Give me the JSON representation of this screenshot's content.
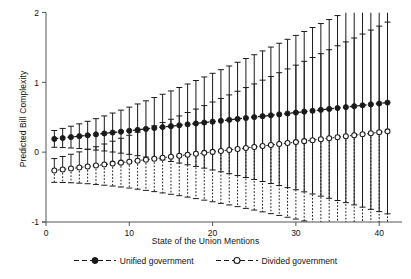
{
  "chart_data": {
    "type": "line",
    "title": "",
    "subtitle": "",
    "xlabel": "State of the Union Mentions",
    "ylabel": "Predicted Bill Complexity",
    "xlim": [
      0,
      42.5
    ],
    "ylim": [
      -1,
      2
    ],
    "xticks": [
      0,
      10,
      20,
      30,
      40
    ],
    "xticklabels": [
      "0",
      "10",
      "20",
      "30",
      "40"
    ],
    "yticks": [
      -1,
      0,
      1,
      2
    ],
    "yticklabels": [
      "-1",
      "0",
      "1",
      "2"
    ],
    "grid": false,
    "legend_position": "bottom-center",
    "x": [
      1,
      2,
      3,
      4,
      5,
      6,
      7,
      8,
      9,
      10,
      11,
      12,
      13,
      14,
      15,
      16,
      17,
      18,
      19,
      20,
      21,
      22,
      23,
      24,
      25,
      26,
      27,
      28,
      29,
      30,
      31,
      32,
      33,
      34,
      35,
      36,
      37,
      38,
      39,
      40,
      41
    ],
    "series": [
      {
        "name": "Unified government",
        "marker": "filled-circle",
        "linestyle": "dashed",
        "color": "#1a1a1a",
        "values": [
          0.19,
          0.203,
          0.216,
          0.229,
          0.242,
          0.255,
          0.268,
          0.281,
          0.294,
          0.307,
          0.32,
          0.333,
          0.346,
          0.359,
          0.372,
          0.385,
          0.398,
          0.411,
          0.424,
          0.437,
          0.45,
          0.463,
          0.476,
          0.489,
          0.502,
          0.515,
          0.528,
          0.541,
          0.554,
          0.567,
          0.58,
          0.593,
          0.606,
          0.619,
          0.632,
          0.645,
          0.658,
          0.671,
          0.684,
          0.697,
          0.71
        ],
        "ci_upper": [
          0.31,
          0.34,
          0.372,
          0.406,
          0.442,
          0.48,
          0.519,
          0.56,
          0.602,
          0.645,
          0.69,
          0.735,
          0.782,
          0.829,
          0.877,
          0.926,
          0.976,
          1.026,
          1.077,
          1.129,
          1.181,
          1.234,
          1.287,
          1.341,
          1.395,
          1.45,
          1.505,
          1.56,
          1.616,
          1.672,
          1.728,
          1.785,
          1.842,
          1.899,
          1.956,
          2.013,
          2.071,
          2.129,
          2.187,
          2.245,
          2.303
        ],
        "ci_lower": [
          0.07,
          0.066,
          0.06,
          0.052,
          0.042,
          0.03,
          0.017,
          0.002,
          -0.014,
          -0.031,
          -0.05,
          -0.069,
          -0.09,
          -0.111,
          -0.133,
          -0.156,
          -0.18,
          -0.204,
          -0.229,
          -0.255,
          -0.281,
          -0.308,
          -0.335,
          -0.363,
          -0.391,
          -0.42,
          -0.449,
          -0.478,
          -0.508,
          -0.538,
          -0.568,
          -0.599,
          -0.63,
          -0.661,
          -0.692,
          -0.723,
          -0.755,
          -0.787,
          -0.819,
          -0.851,
          -0.883
        ]
      },
      {
        "name": "Divided government",
        "marker": "open-circle",
        "linestyle": "dotted",
        "color": "#1a1a1a",
        "values": [
          -0.262,
          -0.248,
          -0.234,
          -0.22,
          -0.206,
          -0.192,
          -0.178,
          -0.164,
          -0.15,
          -0.136,
          -0.122,
          -0.108,
          -0.094,
          -0.08,
          -0.066,
          -0.052,
          -0.038,
          -0.024,
          -0.01,
          0.004,
          0.018,
          0.032,
          0.046,
          0.06,
          0.074,
          0.088,
          0.102,
          0.116,
          0.13,
          0.144,
          0.158,
          0.172,
          0.186,
          0.2,
          0.214,
          0.228,
          0.242,
          0.256,
          0.27,
          0.284,
          0.298
        ],
        "ci_upper": [
          -0.092,
          -0.062,
          -0.03,
          0.004,
          0.04,
          0.078,
          0.117,
          0.157,
          0.199,
          0.242,
          0.286,
          0.331,
          0.377,
          0.424,
          0.471,
          0.519,
          0.568,
          0.617,
          0.667,
          0.718,
          0.769,
          0.82,
          0.872,
          0.925,
          0.977,
          1.031,
          1.084,
          1.138,
          1.192,
          1.246,
          1.301,
          1.356,
          1.411,
          1.467,
          1.523,
          1.579,
          1.635,
          1.691,
          1.748,
          1.805,
          1.862
        ],
        "ci_lower": [
          -0.432,
          -0.434,
          -0.438,
          -0.444,
          -0.452,
          -0.462,
          -0.473,
          -0.485,
          -0.499,
          -0.514,
          -0.53,
          -0.547,
          -0.565,
          -0.584,
          -0.603,
          -0.623,
          -0.644,
          -0.665,
          -0.687,
          -0.71,
          -0.733,
          -0.756,
          -0.78,
          -0.805,
          -0.829,
          -0.855,
          -0.88,
          -0.906,
          -0.932,
          -0.958,
          -0.985,
          -1.012,
          -1.039,
          -1.067,
          -1.095,
          -1.123,
          -1.151,
          -1.179,
          -1.208,
          -1.237,
          -1.266
        ]
      }
    ],
    "legend": [
      {
        "label": "Unified government",
        "marker": "filled-circle",
        "linestyle": "dashed"
      },
      {
        "label": "Divided government",
        "marker": "open-circle",
        "linestyle": "dashed"
      }
    ]
  }
}
